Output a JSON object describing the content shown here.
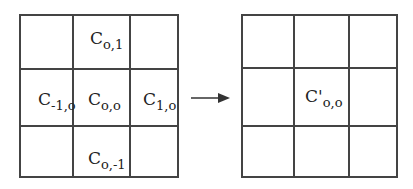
{
  "diagram": {
    "left_grid": {
      "rows": 3,
      "cols": 3,
      "cells": [
        {
          "row": 0,
          "col": 1,
          "base": "C",
          "prime": "",
          "sub": "o,1"
        },
        {
          "row": 1,
          "col": 0,
          "base": "C",
          "prime": "",
          "sub": "-1,o"
        },
        {
          "row": 1,
          "col": 1,
          "base": "C",
          "prime": "",
          "sub": "o,o"
        },
        {
          "row": 1,
          "col": 2,
          "base": "C",
          "prime": "",
          "sub": "1,o"
        },
        {
          "row": 2,
          "col": 1,
          "base": "C",
          "prime": "",
          "sub": "o,-1"
        }
      ]
    },
    "arrow": {
      "direction": "right"
    },
    "right_grid": {
      "rows": 3,
      "cols": 3,
      "cells": [
        {
          "row": 1,
          "col": 1,
          "base": "C",
          "prime": "'",
          "sub": "o,o"
        }
      ]
    },
    "line_color": "#444444"
  }
}
